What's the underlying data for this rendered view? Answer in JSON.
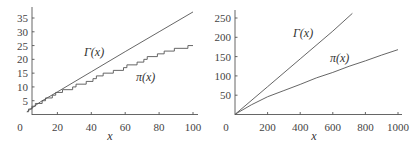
{
  "chart_data": [
    {
      "type": "line",
      "title": "",
      "xlabel": "x",
      "ylabel": "",
      "xlim": [
        0,
        100
      ],
      "ylim": [
        0,
        37
      ],
      "x_ticks": [
        "0",
        "20",
        "40",
        "60",
        "80",
        "100"
      ],
      "y_ticks": [
        "5",
        "10",
        "15",
        "20",
        "25",
        "30",
        "35"
      ],
      "grid": false,
      "series": [
        {
          "name": "Γ(x)",
          "label_display": "Γ(x)",
          "style": "smooth",
          "x": [
            2,
            10,
            20,
            40,
            60,
            80,
            100
          ],
          "y": [
            1.0,
            4.6,
            8.2,
            15.5,
            22.8,
            30.0,
            37.2
          ]
        },
        {
          "name": "π(x)",
          "label_display": "π(x)",
          "style": "step",
          "x": [
            2,
            3,
            5,
            7,
            11,
            13,
            17,
            19,
            23,
            29,
            31,
            37,
            41,
            43,
            47,
            53,
            59,
            61,
            67,
            71,
            73,
            79,
            83,
            89,
            97,
            100
          ],
          "y": [
            1,
            2,
            3,
            4,
            5,
            6,
            7,
            8,
            9,
            10,
            11,
            12,
            13,
            14,
            15,
            16,
            17,
            18,
            19,
            20,
            21,
            22,
            23,
            24,
            25,
            25
          ]
        }
      ]
    },
    {
      "type": "line",
      "title": "",
      "xlabel": "x",
      "ylabel": "",
      "xlim": [
        0,
        1000
      ],
      "ylim": [
        0,
        260
      ],
      "x_ticks": [
        "0",
        "200",
        "400",
        "600",
        "800",
        "1000"
      ],
      "y_ticks": [
        "50",
        "100",
        "150",
        "200",
        "250"
      ],
      "grid": false,
      "series": [
        {
          "name": "Γ(x)",
          "label_display": "Γ(x)",
          "style": "smooth",
          "x": [
            2,
            200,
            400,
            600,
            720
          ],
          "y": [
            1,
            72,
            144,
            216,
            262
          ]
        },
        {
          "name": "π(x)",
          "label_display": "π(x)",
          "style": "step",
          "x": [
            2,
            100,
            200,
            300,
            400,
            500,
            600,
            700,
            800,
            900,
            1000
          ],
          "y": [
            1,
            25,
            46,
            62,
            78,
            95,
            109,
            125,
            139,
            154,
            168
          ]
        }
      ]
    }
  ],
  "labels": {
    "left_gamma": "Γ(x)",
    "left_pi": "π(x)",
    "left_xlabel": "x",
    "left_origin": "0",
    "right_gamma": "Γ(x)",
    "right_pi": "π(x)",
    "right_xlabel": "x",
    "right_origin": "0"
  }
}
